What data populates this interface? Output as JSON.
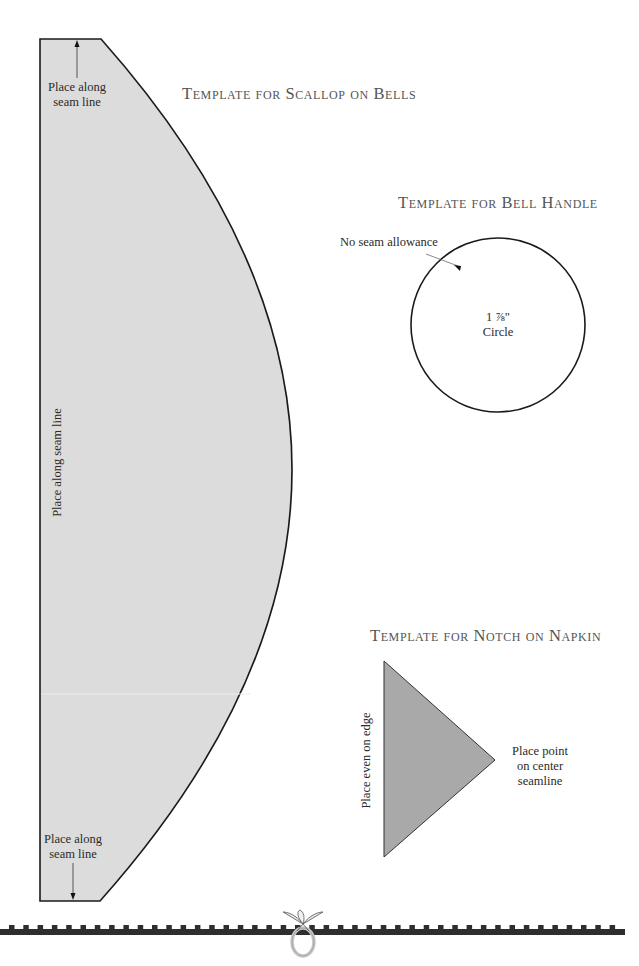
{
  "scallop": {
    "title": "Template for Scallop on Bells",
    "top_label_1": "Place along",
    "top_label_2": "seam line",
    "side_label": "Place along seam line",
    "bottom_label_1": "Place along",
    "bottom_label_2": "seam line",
    "fill_color": "#dcdcdc"
  },
  "bell_handle": {
    "title": "Template for Bell Handle",
    "callout": "No seam allowance",
    "size": "1 ⅞\"",
    "shape": "Circle"
  },
  "notch": {
    "title": "Template for Notch on Napkin",
    "side_label": "Place even on edge",
    "point_label_1": "Place point",
    "point_label_2": "on center",
    "point_label_3": "seamline",
    "fill_color": "#a9a9a9"
  },
  "footer": {
    "border_color": "#2e2e2e",
    "ornament": "ring-with-bow"
  }
}
